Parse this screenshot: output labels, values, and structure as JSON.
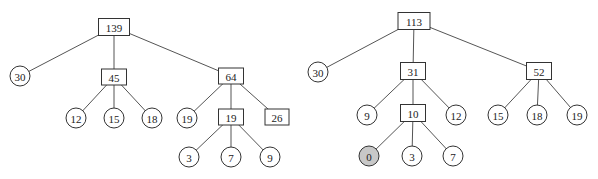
{
  "trees": [
    {
      "id": "left",
      "nodes": [
        {
          "id": "L0",
          "label": "139",
          "shape": "box",
          "x": 114,
          "y": 27,
          "w": 31,
          "h": 17
        },
        {
          "id": "L1",
          "label": "30",
          "shape": "circle",
          "x": 20,
          "y": 76
        },
        {
          "id": "L2",
          "label": "45",
          "shape": "box",
          "x": 114,
          "y": 77,
          "w": 25,
          "h": 16
        },
        {
          "id": "L3",
          "label": "64",
          "shape": "box",
          "x": 231,
          "y": 76,
          "w": 25,
          "h": 16
        },
        {
          "id": "L4",
          "label": "12",
          "shape": "circle",
          "x": 76,
          "y": 118
        },
        {
          "id": "L5",
          "label": "15",
          "shape": "circle",
          "x": 114,
          "y": 118
        },
        {
          "id": "L6",
          "label": "18",
          "shape": "circle",
          "x": 152,
          "y": 118
        },
        {
          "id": "L7",
          "label": "19",
          "shape": "circle",
          "x": 187,
          "y": 118
        },
        {
          "id": "L8",
          "label": "19",
          "shape": "box",
          "x": 231,
          "y": 117,
          "w": 25,
          "h": 16
        },
        {
          "id": "L9",
          "label": "26",
          "shape": "box",
          "x": 277,
          "y": 117,
          "w": 24,
          "h": 16
        },
        {
          "id": "L10",
          "label": "3",
          "shape": "circle",
          "x": 189,
          "y": 157
        },
        {
          "id": "L11",
          "label": "7",
          "shape": "circle",
          "x": 231,
          "y": 157
        },
        {
          "id": "L12",
          "label": "9",
          "shape": "circle",
          "x": 270,
          "y": 157
        }
      ],
      "edges": [
        [
          "L0",
          "L1"
        ],
        [
          "L0",
          "L2"
        ],
        [
          "L0",
          "L3"
        ],
        [
          "L2",
          "L4"
        ],
        [
          "L2",
          "L5"
        ],
        [
          "L2",
          "L6"
        ],
        [
          "L3",
          "L7"
        ],
        [
          "L3",
          "L8"
        ],
        [
          "L3",
          "L9"
        ],
        [
          "L8",
          "L10"
        ],
        [
          "L8",
          "L11"
        ],
        [
          "L8",
          "L12"
        ]
      ]
    },
    {
      "id": "right",
      "nodes": [
        {
          "id": "R0",
          "label": "113",
          "shape": "box",
          "x": 414,
          "y": 21,
          "w": 32,
          "h": 17
        },
        {
          "id": "R1",
          "label": "30",
          "shape": "circle",
          "x": 318,
          "y": 72
        },
        {
          "id": "R2",
          "label": "31",
          "shape": "box",
          "x": 413,
          "y": 71,
          "w": 25,
          "h": 17
        },
        {
          "id": "R3",
          "label": "52",
          "shape": "box",
          "x": 539,
          "y": 71,
          "w": 25,
          "h": 17
        },
        {
          "id": "R4",
          "label": "9",
          "shape": "circle",
          "x": 367,
          "y": 115
        },
        {
          "id": "R5",
          "label": "10",
          "shape": "box",
          "x": 413,
          "y": 113,
          "w": 25,
          "h": 17
        },
        {
          "id": "R6",
          "label": "12",
          "shape": "circle",
          "x": 456,
          "y": 115
        },
        {
          "id": "R7",
          "label": "15",
          "shape": "circle",
          "x": 498,
          "y": 115
        },
        {
          "id": "R8",
          "label": "18",
          "shape": "circle",
          "x": 537,
          "y": 115
        },
        {
          "id": "R9",
          "label": "19",
          "shape": "circle",
          "x": 577,
          "y": 115
        },
        {
          "id": "R10",
          "label": "0",
          "shape": "circle",
          "x": 369,
          "y": 156,
          "highlight": true
        },
        {
          "id": "R11",
          "label": "3",
          "shape": "circle",
          "x": 412,
          "y": 156
        },
        {
          "id": "R12",
          "label": "7",
          "shape": "circle",
          "x": 453,
          "y": 156
        }
      ],
      "edges": [
        [
          "R0",
          "R1"
        ],
        [
          "R0",
          "R2"
        ],
        [
          "R0",
          "R3"
        ],
        [
          "R2",
          "R4"
        ],
        [
          "R2",
          "R5"
        ],
        [
          "R2",
          "R6"
        ],
        [
          "R3",
          "R7"
        ],
        [
          "R3",
          "R8"
        ],
        [
          "R3",
          "R9"
        ],
        [
          "R5",
          "R10"
        ],
        [
          "R5",
          "R11"
        ],
        [
          "R5",
          "R12"
        ]
      ]
    }
  ],
  "style": {
    "circle_radius": 10,
    "highlight_fill": "#c8c8c8",
    "stroke": "#333333"
  }
}
